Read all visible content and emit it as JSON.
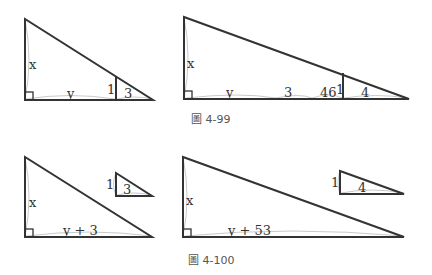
{
  "figures": [
    {
      "caption": "圖 4-99",
      "left": {
        "labels": {
          "height": "x",
          "base": "y",
          "inner_height": "1",
          "inner_base": "3"
        }
      },
      "right": {
        "labels": {
          "height": "x",
          "base_y": "y",
          "base_3": "3",
          "base_46": "46",
          "inner_height": "1",
          "inner_base": "4"
        }
      }
    },
    {
      "caption": "圖 4-100",
      "left": {
        "labels": {
          "height": "x",
          "base": "y + 3"
        },
        "small": {
          "height": "1",
          "base": "3"
        }
      },
      "right": {
        "labels": {
          "height": "x",
          "base": "y + 53"
        },
        "small": {
          "height": "1",
          "base": "4"
        }
      }
    }
  ],
  "colors": {
    "stroke": "#333333",
    "guide": "#bbbbbb",
    "caption": "#555555"
  }
}
